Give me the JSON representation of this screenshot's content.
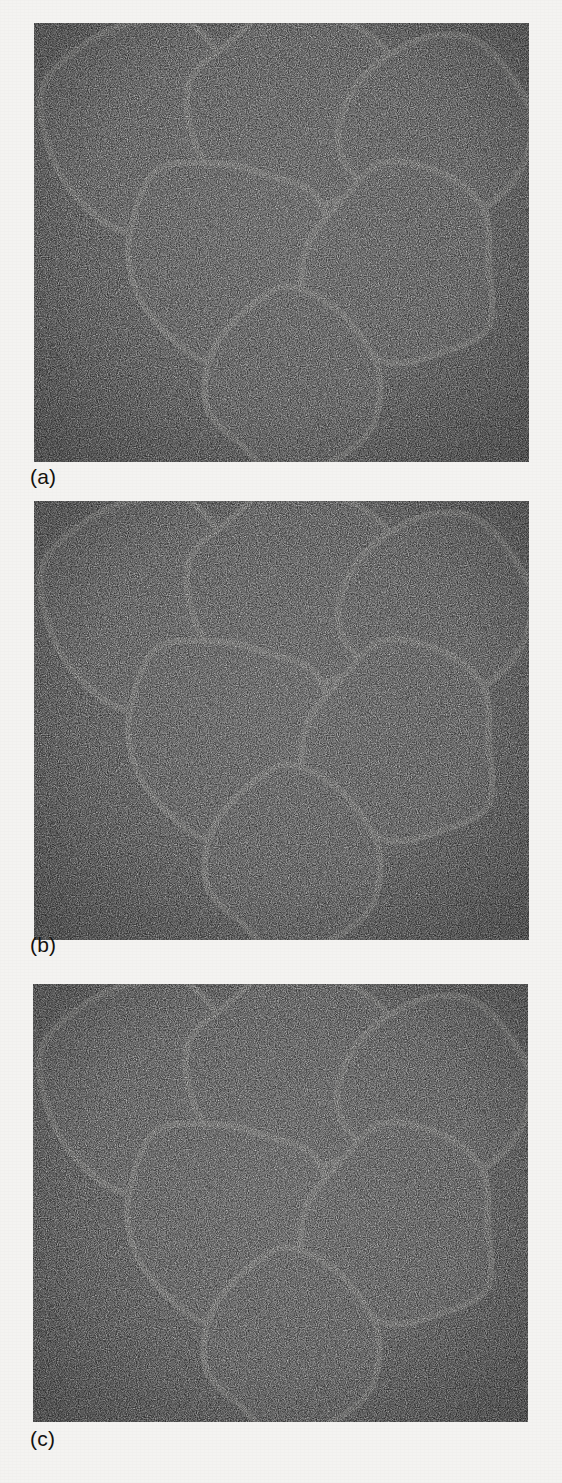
{
  "figure": {
    "type": "multi-panel-micrograph",
    "panel_count": 3,
    "background_color": "#f4f3f1",
    "matrix_color": "#0d0d0d",
    "grain_fill_color": "#787878",
    "grain_rim_color": "#f0efe9",
    "fine_particle_color": "#b9b9b9",
    "pore_color": "#151515"
  },
  "panels": [
    {
      "label": "(a)",
      "label_x": 30,
      "label_y": 466,
      "frame": {
        "x": 34,
        "y": 23,
        "w": 495,
        "h": 439
      },
      "description": "Coarse grains only, empty pore space",
      "fine_particles": {
        "present": false,
        "radius": 0,
        "count": 0
      },
      "grains": [
        {
          "id": "top-left",
          "cx": 144,
          "cy": 121,
          "r": 104,
          "seed": 11
        },
        {
          "id": "top-middle",
          "cx": 291,
          "cy": 113,
          "r": 104,
          "seed": 23
        },
        {
          "id": "top-right",
          "cx": 438,
          "cy": 128,
          "r": 93,
          "seed": 37
        },
        {
          "id": "middle-left",
          "cx": 225,
          "cy": 254,
          "r": 100,
          "seed": 51
        },
        {
          "id": "middle-right",
          "cx": 400,
          "cy": 268,
          "r": 98,
          "seed": 67
        },
        {
          "id": "bottom",
          "cx": 296,
          "cy": 383,
          "r": 88,
          "seed": 83
        }
      ],
      "pores": []
    },
    {
      "label": "(b)",
      "label_x": 30,
      "label_y": 934,
      "frame": {
        "x": 34,
        "y": 501,
        "w": 495,
        "h": 439
      },
      "description": "Coarse grains with coarse fine-fraction filling the pores",
      "fine_particles": {
        "present": true,
        "radius": 5.5,
        "count": 130
      },
      "grains": [
        {
          "id": "top-left",
          "cx": 144,
          "cy": 599,
          "r": 104,
          "seed": 11
        },
        {
          "id": "top-middle",
          "cx": 291,
          "cy": 591,
          "r": 104,
          "seed": 23
        },
        {
          "id": "top-right",
          "cx": 438,
          "cy": 606,
          "r": 93,
          "seed": 37
        },
        {
          "id": "middle-left",
          "cx": 225,
          "cy": 732,
          "r": 100,
          "seed": 51
        },
        {
          "id": "middle-right",
          "cx": 400,
          "cy": 746,
          "r": 98,
          "seed": 67
        },
        {
          "id": "bottom",
          "cx": 296,
          "cy": 861,
          "r": 88,
          "seed": 83
        }
      ],
      "pores": [
        {
          "id": "pore-upper-left",
          "ax": 210,
          "ay": 658,
          "bx": 262,
          "by": 650,
          "cx": 219,
          "cy": 702
        },
        {
          "id": "pore-upper-right",
          "ax": 371,
          "ay": 661,
          "bx": 417,
          "by": 650,
          "cx": 392,
          "cy": 700
        },
        {
          "id": "pore-center",
          "ax": 282,
          "ay": 686,
          "bx": 333,
          "by": 690,
          "cx": 300,
          "cy": 742
        },
        {
          "id": "pore-lower",
          "ax": 276,
          "ay": 820,
          "bx": 327,
          "by": 818,
          "cx": 300,
          "cy": 862
        }
      ]
    },
    {
      "label": "(c)",
      "label_x": 30,
      "label_y": 1428,
      "frame": {
        "x": 33,
        "y": 984,
        "w": 495,
        "h": 438
      },
      "description": "Coarse grains with finer, more densely packed fine-fraction filling the pores",
      "fine_particles": {
        "present": true,
        "radius": 3.1,
        "count": 360
      },
      "grains": [
        {
          "id": "top-left",
          "cx": 143,
          "cy": 1082,
          "r": 104,
          "seed": 11
        },
        {
          "id": "top-middle",
          "cx": 290,
          "cy": 1074,
          "r": 104,
          "seed": 23
        },
        {
          "id": "top-right",
          "cx": 437,
          "cy": 1089,
          "r": 93,
          "seed": 37
        },
        {
          "id": "middle-left",
          "cx": 224,
          "cy": 1215,
          "r": 100,
          "seed": 51
        },
        {
          "id": "middle-right",
          "cx": 399,
          "cy": 1229,
          "r": 98,
          "seed": 67
        },
        {
          "id": "bottom",
          "cx": 295,
          "cy": 1344,
          "r": 88,
          "seed": 83
        }
      ],
      "pores": [
        {
          "id": "pore-upper-left",
          "ax": 209,
          "ay": 1141,
          "bx": 261,
          "by": 1133,
          "cx": 218,
          "cy": 1185
        },
        {
          "id": "pore-upper-right",
          "ax": 370,
          "ay": 1144,
          "bx": 416,
          "by": 1133,
          "cx": 391,
          "cy": 1183
        },
        {
          "id": "pore-center",
          "ax": 281,
          "ay": 1169,
          "bx": 332,
          "by": 1173,
          "cx": 299,
          "cy": 1225
        },
        {
          "id": "pore-lower",
          "ax": 275,
          "ay": 1303,
          "bx": 326,
          "by": 1301,
          "cx": 299,
          "cy": 1345
        }
      ]
    }
  ]
}
